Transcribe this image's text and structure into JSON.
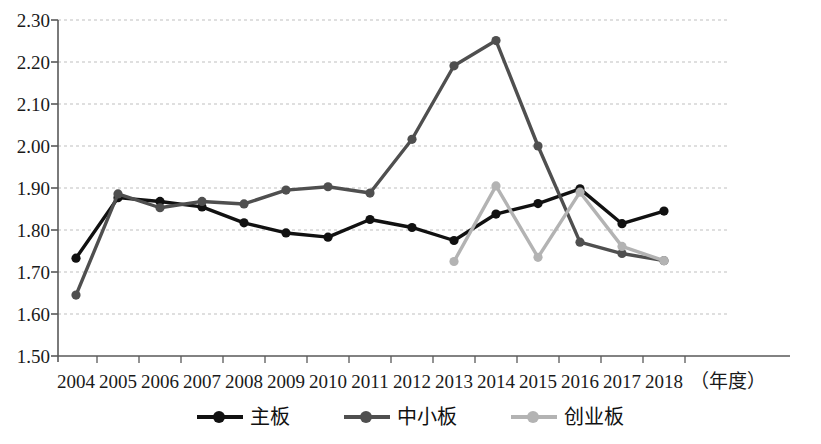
{
  "chart_data": {
    "type": "line",
    "title": "",
    "xlabel": "（年度）",
    "ylabel": "",
    "categories": [
      "2004",
      "2005",
      "2006",
      "2007",
      "2008",
      "2009",
      "2010",
      "2011",
      "2012",
      "2013",
      "2014",
      "2015",
      "2016",
      "2017",
      "2018"
    ],
    "ylim": [
      1.5,
      2.3
    ],
    "ytick_labels": [
      "2.30",
      "2.20",
      "2.10",
      "2.00",
      "1.90",
      "1.80",
      "1.70",
      "1.60",
      "1.50"
    ],
    "ytick_values": [
      2.3,
      2.2,
      2.1,
      2.0,
      1.9,
      1.8,
      1.7,
      1.6,
      1.5
    ],
    "grid": true,
    "grid_style": "dashed-horizontal",
    "legend_position": "bottom-center",
    "series": [
      {
        "name": "主板",
        "color": "#111111",
        "values": [
          1.733,
          1.877,
          1.868,
          1.855,
          1.817,
          1.793,
          1.783,
          1.825,
          1.806,
          1.775,
          1.838,
          1.863,
          1.898,
          1.815,
          1.845
        ]
      },
      {
        "name": "中小板",
        "color": "#4f4f4f",
        "values": [
          1.645,
          1.886,
          1.853,
          1.868,
          1.862,
          1.895,
          1.903,
          1.888,
          2.016,
          2.191,
          2.251,
          2.0,
          1.771,
          1.744,
          1.727
        ]
      },
      {
        "name": "创业板",
        "color": "#b3b3b3",
        "values": [
          null,
          null,
          null,
          null,
          null,
          null,
          null,
          null,
          null,
          1.725,
          1.905,
          1.735,
          1.89,
          1.761,
          1.727
        ]
      }
    ]
  },
  "legend": {
    "items": [
      {
        "label": "主板",
        "color": "#111111"
      },
      {
        "label": "中小板",
        "color": "#4f4f4f"
      },
      {
        "label": "创业板",
        "color": "#b3b3b3"
      }
    ]
  },
  "axes": {
    "x_unit": "（年度）",
    "axis_color": "#595959",
    "grid_color": "#bfbfbf"
  }
}
